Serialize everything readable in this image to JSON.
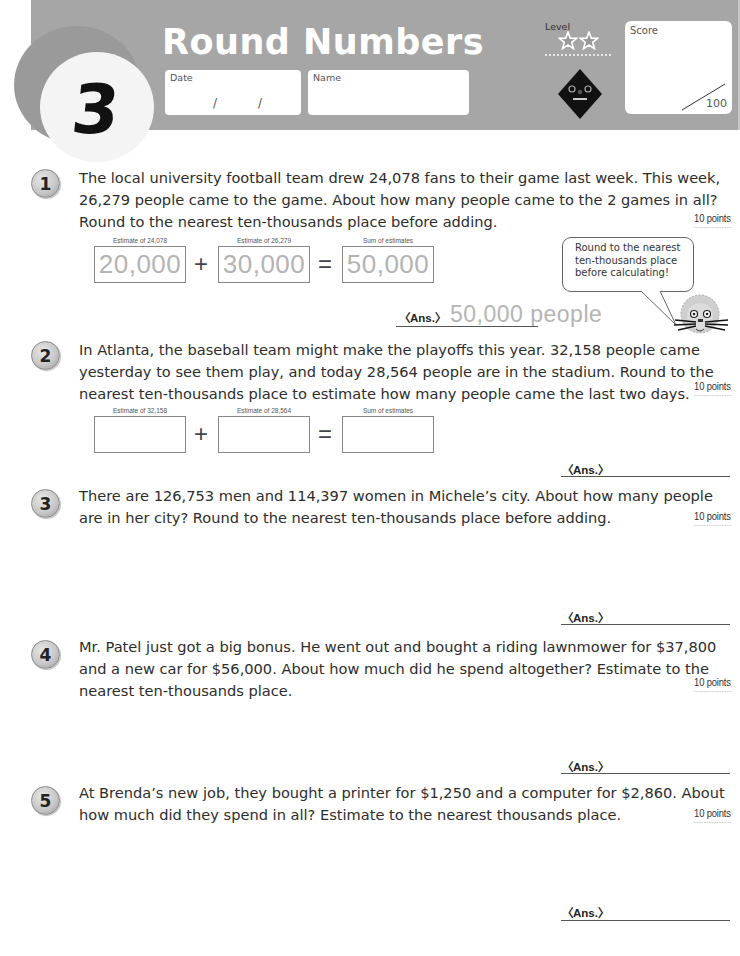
{
  "header": {
    "unit_number": "3",
    "title": "Round Numbers",
    "date_label": "Date",
    "date_separator": "/",
    "name_label": "Name",
    "level_label": "Level",
    "level_stars": 2,
    "score_label": "Score",
    "score_total": "100"
  },
  "colors": {
    "header_band": "#a6a6a6",
    "badge_ring": "#9a9a9a",
    "answer_gray": "#b4b4b4"
  },
  "questions": [
    {
      "number": "1",
      "text": "The local university football team drew 24,078 fans to their game last week. This week, 26,279 people came to the game. About how many people came to the 2 games in all? Round to the nearest ten-thousands place before adding.",
      "points": "10 points",
      "estimates": [
        {
          "label": "Estimate of 24,078",
          "value": "20,000"
        },
        {
          "label": "Estimate of 26,279",
          "value": "30,000"
        },
        {
          "label": "Sum of estimates",
          "value": "50,000"
        }
      ],
      "operator_plus": "+",
      "operator_equals": "=",
      "answer_label": "〈Ans.〉",
      "answer_value": "50,000  people"
    },
    {
      "number": "2",
      "text": "In Atlanta, the baseball team might make the playoffs this year. 32,158 people came yesterday to see them play, and today 28,564 people are in the stadium. Round to the nearest ten-thousands place to estimate how many people came the last two days.",
      "points": "10 points",
      "estimates": [
        {
          "label": "Estimate of 32,158",
          "value": ""
        },
        {
          "label": "Estimate of 28,564",
          "value": ""
        },
        {
          "label": "Sum of estimates",
          "value": ""
        }
      ],
      "operator_plus": "+",
      "operator_equals": "=",
      "answer_label": "〈Ans.〉",
      "answer_value": ""
    },
    {
      "number": "3",
      "text": "There are 126,753 men and 114,397 women in Michele’s city. About how many people are in her city? Round to the nearest ten-thousands place before adding.",
      "points": "10 points",
      "answer_label": "〈Ans.〉",
      "answer_value": ""
    },
    {
      "number": "4",
      "text": "Mr. Patel just got a big bonus. He went out and bought a riding lawnmower for $37,800 and a new car for $56,000. About how much did he spend altogether? Estimate to the nearest ten-thousands place.",
      "points": "10 points",
      "answer_label": "〈Ans.〉",
      "answer_value": ""
    },
    {
      "number": "5",
      "text": "At Brenda’s new job, they bought a printer for $1,250 and a computer for $2,860. About how much did they spend in all? Estimate to the nearest thousands place.",
      "points": "10 points",
      "answer_label": "〈Ans.〉",
      "answer_value": ""
    }
  ],
  "hint_bubble": {
    "text": "Round to the nearest ten-thousands place before calculating!",
    "icon": "lion-mascot-icon"
  }
}
